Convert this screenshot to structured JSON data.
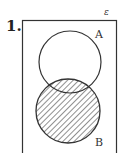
{
  "question": {
    "number": "1."
  },
  "diagram": {
    "type": "venn",
    "universal_symbol": "ε",
    "sets": [
      {
        "name": "A",
        "shaded": false
      },
      {
        "name": "B",
        "shaded": true
      }
    ],
    "shaded_region": "B",
    "hatch_color": "#444444",
    "line_color": "#333333"
  }
}
